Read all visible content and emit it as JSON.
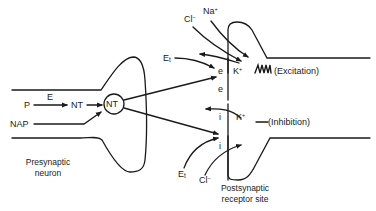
{
  "diagram": {
    "presynaptic": {
      "caption_line1": "Presynaptic",
      "caption_line2": "neuron",
      "p": "P",
      "e": "E",
      "nt": "NT",
      "nt_vesicle": "NT",
      "nap": "NAP"
    },
    "postsynaptic": {
      "caption_line1": "Postsynaptic",
      "caption_line2": "receptor site",
      "excitatory": {
        "et": "E",
        "et_sub": "t",
        "cl": "Cl",
        "cl_sup": "−",
        "na": "Na",
        "na_sup": "+",
        "k": "K",
        "k_sup": "+",
        "e1": "e",
        "e2": "e",
        "label": "(Excitation)"
      },
      "inhibitory": {
        "et": "E",
        "et_sub": "t",
        "cl": "Cl",
        "cl_sup": "−",
        "k": "K",
        "k_sup": "+",
        "i1": "i",
        "i2": "i",
        "label": "(Inhibition)"
      }
    }
  }
}
